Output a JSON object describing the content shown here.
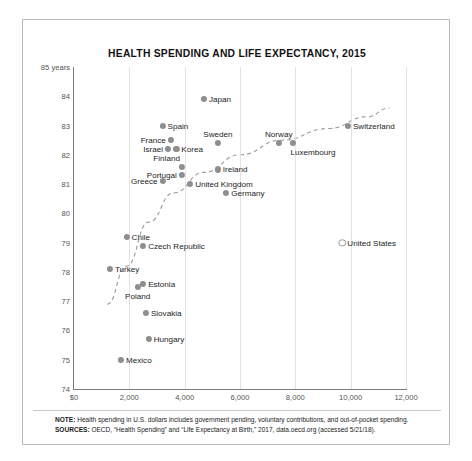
{
  "chart_data": {
    "type": "scatter",
    "title": "HEALTH SPENDING AND LIFE EXPECTANCY, 2015",
    "xlabel": "",
    "ylabel": "",
    "ylim": [
      74,
      85
    ],
    "xlim": [
      0,
      12000
    ],
    "grid": true,
    "legend_position": "none",
    "y_axis_top_label": "85 years",
    "y_ticks": [
      "85 years",
      "84",
      "83",
      "82",
      "81",
      "80",
      "79",
      "78",
      "77",
      "76",
      "75",
      "74"
    ],
    "y_tick_values": [
      85,
      84,
      83,
      82,
      81,
      80,
      79,
      78,
      77,
      76,
      75,
      74
    ],
    "x_ticks": [
      "$0",
      "2,000",
      "4,000",
      "6,000",
      "8,000",
      "10,000",
      "12,000"
    ],
    "x_tick_values": [
      0,
      2000,
      4000,
      6000,
      8000,
      10000,
      12000
    ],
    "x_unit": "U.S. dollars of health spending per capita",
    "y_unit": "life expectancy at birth, years",
    "trendline": {
      "style": "dashed",
      "color": "#9a9a9a",
      "points": [
        [
          1200,
          76.9
        ],
        [
          1900,
          78.2
        ],
        [
          2700,
          79.7
        ],
        [
          3600,
          80.7
        ],
        [
          4700,
          81.4
        ],
        [
          6000,
          82.0
        ],
        [
          7500,
          82.5
        ],
        [
          9200,
          82.9
        ],
        [
          10600,
          83.3
        ],
        [
          11400,
          83.6
        ]
      ]
    },
    "points": [
      {
        "label": "Japan",
        "x": 4700,
        "y": 83.9,
        "label_pos": "right",
        "marker": "filled"
      },
      {
        "label": "Spain",
        "x": 3200,
        "y": 83.0,
        "label_pos": "right",
        "marker": "filled"
      },
      {
        "label": "Switzerland",
        "x": 9900,
        "y": 83.0,
        "label_pos": "right",
        "marker": "filled"
      },
      {
        "label": "Norway",
        "x": 7400,
        "y": 82.4,
        "label_pos": "above",
        "marker": "filled"
      },
      {
        "label": "France",
        "x": 3500,
        "y": 82.5,
        "label_pos": "left",
        "marker": "filled"
      },
      {
        "label": "Sweden",
        "x": 5200,
        "y": 82.4,
        "label_pos": "above",
        "marker": "filled"
      },
      {
        "label": "Luxembourg",
        "x": 7900,
        "y": 82.4,
        "label_pos": "below-right",
        "marker": "filled"
      },
      {
        "label": "Israel",
        "x": 3400,
        "y": 82.2,
        "label_pos": "left",
        "marker": "filled"
      },
      {
        "label": "Korea",
        "x": 3700,
        "y": 82.2,
        "label_pos": "right",
        "marker": "filled"
      },
      {
        "label": "Finland",
        "x": 3900,
        "y": 81.6,
        "label_pos": "above-left",
        "marker": "filled"
      },
      {
        "label": "Ireland",
        "x": 5200,
        "y": 81.5,
        "label_pos": "right",
        "marker": "filled"
      },
      {
        "label": "Portugal",
        "x": 3900,
        "y": 81.3,
        "label_pos": "left",
        "marker": "filled"
      },
      {
        "label": "Greece",
        "x": 3200,
        "y": 81.1,
        "label_pos": "left",
        "marker": "filled"
      },
      {
        "label": "United Kingdom",
        "x": 4200,
        "y": 81.0,
        "label_pos": "right",
        "marker": "filled"
      },
      {
        "label": "Germany",
        "x": 5500,
        "y": 80.7,
        "label_pos": "right",
        "marker": "filled"
      },
      {
        "label": "Chile",
        "x": 1900,
        "y": 79.2,
        "label_pos": "right",
        "marker": "filled"
      },
      {
        "label": "Czech Republic",
        "x": 2500,
        "y": 78.9,
        "label_pos": "right",
        "marker": "filled"
      },
      {
        "label": "United States",
        "x": 9700,
        "y": 79.0,
        "label_pos": "right",
        "marker": "hollow"
      },
      {
        "label": "Turkey",
        "x": 1300,
        "y": 78.1,
        "label_pos": "right",
        "marker": "filled"
      },
      {
        "label": "Estonia",
        "x": 2500,
        "y": 77.6,
        "label_pos": "right",
        "marker": "filled"
      },
      {
        "label": "Poland",
        "x": 2300,
        "y": 77.5,
        "label_pos": "below",
        "marker": "filled"
      },
      {
        "label": "Slovakia",
        "x": 2600,
        "y": 76.6,
        "label_pos": "right",
        "marker": "filled"
      },
      {
        "label": "Hungary",
        "x": 2700,
        "y": 75.7,
        "label_pos": "right",
        "marker": "filled"
      },
      {
        "label": "Mexico",
        "x": 1700,
        "y": 75.0,
        "label_pos": "right",
        "marker": "filled"
      }
    ]
  },
  "notes": {
    "note_label": "NOTE:",
    "note_text": " Health spending in U.S. dollars includes government pending, voluntary contributions, and out-of-pocket spending.",
    "sources_label": "SOURCES:",
    "sources_text": " OECD, “Health Spending” and “Life Expectancy at Birth,” 2017, data.oecd.org (accessed 5/21/18)."
  },
  "colors": {
    "marker": "#8e8e8e",
    "trendline": "#9a9a9a",
    "axis": "#7c7c7c",
    "grid": "#e2e2e2",
    "text": "#1d1d1d"
  }
}
